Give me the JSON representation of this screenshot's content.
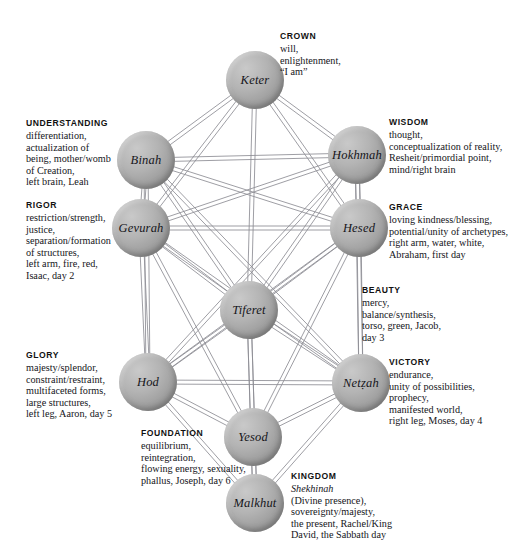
{
  "diagram": {
    "background_color": "#ffffff",
    "node_color": "#a8a8a8",
    "edge_color": "#8d8d93"
  },
  "nodes": [
    {
      "id": "keter",
      "label": "Keter",
      "x": 255,
      "y": 80,
      "r": 29
    },
    {
      "id": "binah",
      "label": "Binah",
      "x": 146,
      "y": 160,
      "r": 29
    },
    {
      "id": "hokhmah",
      "label": "Hokhmah",
      "x": 357,
      "y": 155,
      "r": 29
    },
    {
      "id": "gevurah",
      "label": "Gevurah",
      "x": 141,
      "y": 228,
      "r": 29
    },
    {
      "id": "hesed",
      "label": "Hesed",
      "x": 359,
      "y": 228,
      "r": 29
    },
    {
      "id": "tiferet",
      "label": "Tiferet",
      "x": 249,
      "y": 310,
      "r": 29
    },
    {
      "id": "hod",
      "label": "Hod",
      "x": 148,
      "y": 382,
      "r": 29
    },
    {
      "id": "netzah",
      "label": "Netẓah",
      "x": 361,
      "y": 383,
      "r": 29
    },
    {
      "id": "yesod",
      "label": "Yesod",
      "x": 253,
      "y": 437,
      "r": 29
    },
    {
      "id": "malkhut",
      "label": "Malkhut",
      "x": 255,
      "y": 503,
      "r": 29
    }
  ],
  "edges": [
    [
      "keter",
      "binah"
    ],
    [
      "keter",
      "hokhmah"
    ],
    [
      "keter",
      "tiferet"
    ],
    [
      "keter",
      "gevurah"
    ],
    [
      "keter",
      "hesed"
    ],
    [
      "binah",
      "hokhmah"
    ],
    [
      "binah",
      "gevurah"
    ],
    [
      "binah",
      "tiferet"
    ],
    [
      "binah",
      "hesed"
    ],
    [
      "binah",
      "hod"
    ],
    [
      "binah",
      "netzah"
    ],
    [
      "hokhmah",
      "hesed"
    ],
    [
      "hokhmah",
      "tiferet"
    ],
    [
      "hokhmah",
      "gevurah"
    ],
    [
      "hokhmah",
      "netzah"
    ],
    [
      "hokhmah",
      "hod"
    ],
    [
      "gevurah",
      "hesed"
    ],
    [
      "gevurah",
      "tiferet"
    ],
    [
      "gevurah",
      "hod"
    ],
    [
      "gevurah",
      "netzah"
    ],
    [
      "gevurah",
      "yesod"
    ],
    [
      "hesed",
      "tiferet"
    ],
    [
      "hesed",
      "netzah"
    ],
    [
      "hesed",
      "hod"
    ],
    [
      "hesed",
      "yesod"
    ],
    [
      "tiferet",
      "hod"
    ],
    [
      "tiferet",
      "netzah"
    ],
    [
      "tiferet",
      "yesod"
    ],
    [
      "tiferet",
      "malkhut"
    ],
    [
      "hod",
      "netzah"
    ],
    [
      "hod",
      "yesod"
    ],
    [
      "hod",
      "malkhut"
    ],
    [
      "netzah",
      "yesod"
    ],
    [
      "netzah",
      "malkhut"
    ],
    [
      "yesod",
      "malkhut"
    ]
  ],
  "labels": [
    {
      "id": "crown",
      "title": "CROWN",
      "body": "will,\nenlightenment,\n“I am”",
      "x": 280,
      "y": 30,
      "align": "left"
    },
    {
      "id": "understanding",
      "title": "UNDERSTANDING",
      "body": "differentiation,\nactualization of\nbeing, mother/womb\nof Creation,\nleft brain, Leah",
      "x": 26,
      "y": 117,
      "align": "left"
    },
    {
      "id": "wisdom",
      "title": "WISDOM",
      "body": "thought,\nconceptualization of reality,\nResheit/primordial point,\nmind/right brain",
      "x": 389,
      "y": 116,
      "align": "left"
    },
    {
      "id": "rigor",
      "title": "RIGOR",
      "body": "restriction/strength,\njustice,\nseparation/formation\nof structures,\nleft arm, fire, red,\nIsaac, day 2",
      "x": 26,
      "y": 199,
      "align": "left"
    },
    {
      "id": "grace",
      "title": "GRACE",
      "body": "loving kindness/blessing,\npotential/unity of archetypes,\nright arm, water, white,\nAbraham, first day",
      "x": 389,
      "y": 201,
      "align": "left"
    },
    {
      "id": "beauty",
      "title": "BEAUTY",
      "body": "mercy,\nbalance/synthesis,\ntorso, green, Jacob,\nday 3",
      "x": 362,
      "y": 284,
      "align": "left"
    },
    {
      "id": "glory",
      "title": "GLORY",
      "body": "majesty/splendor,\nconstraint/restraint,\nmultifaceted forms,\nlarge structures,\nleft leg, Aaron, day 5",
      "x": 26,
      "y": 349,
      "align": "left"
    },
    {
      "id": "victory",
      "title": "VICTORY",
      "body": "endurance,\nunity of possibilities,\nprophecy,\nmanifested world,\nright leg, Moses, day 4",
      "x": 389,
      "y": 356,
      "align": "left"
    },
    {
      "id": "foundation",
      "title": "FOUNDATION",
      "body": "equilibrium,\nreintegration,\nflowing energy, sexuality,\nphallus, Joseph, day 6",
      "x": 141,
      "y": 427,
      "align": "left"
    },
    {
      "id": "kingdom",
      "title": "KINGDOM",
      "body": "Shekhinah\n(Divine presence),\nsovereignty/majesty,\nthe present, Rachel/King\nDavid, the Sabbath day",
      "x": 291,
      "y": 470,
      "align": "left",
      "first_line_italic": true
    }
  ]
}
